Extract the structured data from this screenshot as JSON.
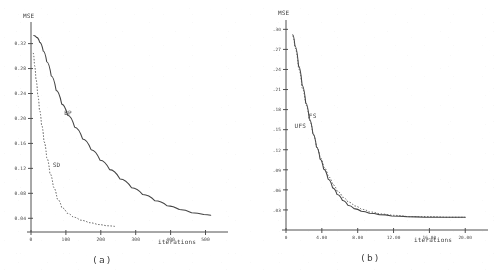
{
  "figure": {
    "panel_a_caption": "(a)",
    "panel_b_caption": "(b)"
  },
  "chart_data": [
    {
      "type": "line",
      "panel": "(a)",
      "title": "",
      "ylabel": "MSE",
      "xlabel": "iterations",
      "xlim": [
        0,
        530
      ],
      "ylim": [
        0.018,
        0.345
      ],
      "grid": false,
      "legend": "inline-curve-labels",
      "xticks": [
        0,
        100,
        200,
        300,
        400,
        500
      ],
      "xticklabels": [
        "0",
        "100",
        "200",
        "300",
        "400",
        "500"
      ],
      "yticks": [
        0.04,
        0.08,
        0.12,
        0.16,
        0.2,
        0.24,
        0.28,
        0.32
      ],
      "yticklabels": [
        "0.04",
        "0.08",
        "0.12",
        "0.16",
        "0.20",
        "0.24",
        "0.28",
        "0.32"
      ],
      "series": [
        {
          "name": "BP",
          "style": "solid",
          "label_x": 95,
          "label_y": 0.205,
          "x": [
            8,
            16,
            25,
            35,
            45,
            58,
            72,
            88,
            105,
            125,
            148,
            172,
            198,
            225,
            255,
            288,
            320,
            355,
            390,
            425,
            460,
            495,
            515
          ],
          "y": [
            0.333,
            0.33,
            0.322,
            0.308,
            0.291,
            0.268,
            0.245,
            0.223,
            0.205,
            0.186,
            0.167,
            0.15,
            0.133,
            0.118,
            0.103,
            0.089,
            0.078,
            0.068,
            0.06,
            0.054,
            0.049,
            0.046,
            0.045
          ]
        },
        {
          "name": "SD",
          "style": "dotted",
          "label_x": 62,
          "label_y": 0.122,
          "x": [
            6,
            10,
            14,
            19,
            24,
            30,
            37,
            45,
            54,
            64,
            75,
            88,
            103,
            120,
            140,
            165,
            190,
            215,
            240
          ],
          "y": [
            0.305,
            0.285,
            0.263,
            0.238,
            0.214,
            0.19,
            0.163,
            0.137,
            0.112,
            0.09,
            0.071,
            0.057,
            0.048,
            0.042,
            0.037,
            0.033,
            0.03,
            0.028,
            0.027
          ]
        }
      ]
    },
    {
      "type": "line",
      "panel": "(b)",
      "title": "",
      "ylabel": "MSE",
      "xlabel": "iterations",
      "xlim": [
        0,
        21.2
      ],
      "ylim": [
        0.0,
        0.305
      ],
      "grid": false,
      "legend": "inline-curve-labels",
      "xticks": [
        0,
        4.0,
        8.0,
        12.0,
        16.0,
        20.0
      ],
      "xticklabels": [
        "0",
        "4.00",
        "8.00",
        "12.00",
        "16.00",
        "20.00"
      ],
      "yticks": [
        0.03,
        0.06,
        0.09,
        0.12,
        0.15,
        0.18,
        0.21,
        0.24,
        0.27,
        0.3
      ],
      "yticklabels": [
        ".03",
        ".06",
        ".09",
        ".12",
        ".15",
        ".18",
        ".21",
        ".24",
        ".27",
        ".30"
      ],
      "series": [
        {
          "name": "FS",
          "style": "solid",
          "label_x": 2.55,
          "label_y": 0.168,
          "x": [
            0.75,
            1.0,
            1.4,
            1.8,
            2.2,
            2.6,
            3.0,
            3.4,
            3.8,
            4.2,
            4.7,
            5.2,
            5.7,
            6.3,
            6.9,
            7.6,
            8.4,
            9.3,
            10.4,
            11.8,
            13.5,
            15.5,
            17.8,
            20.0
          ],
          "y": [
            0.292,
            0.275,
            0.245,
            0.216,
            0.19,
            0.166,
            0.144,
            0.124,
            0.106,
            0.091,
            0.076,
            0.063,
            0.053,
            0.044,
            0.037,
            0.032,
            0.028,
            0.025,
            0.023,
            0.021,
            0.02,
            0.019,
            0.019,
            0.019
          ]
        },
        {
          "name": "UFS",
          "style": "dotted",
          "label_x": 0.95,
          "label_y": 0.152,
          "x": [
            0.75,
            1.0,
            1.4,
            1.8,
            2.2,
            2.6,
            3.0,
            3.4,
            3.8,
            4.2,
            4.7,
            5.2,
            5.7,
            6.3,
            6.9,
            7.6,
            8.4,
            9.3,
            10.4,
            11.8,
            13.5,
            15.5,
            17.8,
            20.0
          ],
          "y": [
            0.29,
            0.272,
            0.241,
            0.212,
            0.187,
            0.164,
            0.143,
            0.124,
            0.108,
            0.094,
            0.08,
            0.068,
            0.058,
            0.049,
            0.042,
            0.036,
            0.031,
            0.027,
            0.024,
            0.022,
            0.02,
            0.02,
            0.019,
            0.019
          ]
        }
      ]
    }
  ]
}
